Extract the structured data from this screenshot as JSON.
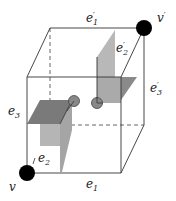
{
  "diagram": {
    "title": "",
    "colors": {
      "edge": "#333333",
      "dashed": "#555555",
      "flag_dark": "#7a7a7a",
      "flag_light": "#b3b3b3",
      "flag_mid": "#959595",
      "vertex": "#000000",
      "small_circle": "#888888"
    },
    "labels": {
      "e1_prime": "e′₁",
      "e2_prime": "e′₂",
      "e3_prime": "e′₃",
      "e3": "e₃",
      "e2": "e₂",
      "e1": "e₁",
      "v_prime": "v′",
      "v": "v"
    },
    "label_parts": {
      "e1p": {
        "base": "e",
        "sup": "′",
        "sub": "1"
      },
      "e2p": {
        "base": "e",
        "sup": "′",
        "sub": "2"
      },
      "e3p": {
        "base": "e",
        "sup": "′",
        "sub": "3"
      },
      "e3": {
        "base": "e",
        "sub": "3"
      },
      "e2": {
        "base": "e",
        "sup": "′",
        "sub": "2"
      },
      "e1": {
        "base": "e",
        "sub": "1"
      },
      "vp": {
        "base": "v",
        "sup": "′"
      },
      "v": {
        "base": "v"
      }
    },
    "vertices": [
      {
        "name": "v",
        "x": 27,
        "y": 173
      },
      {
        "name": "v'",
        "x": 144,
        "y": 28
      }
    ]
  }
}
